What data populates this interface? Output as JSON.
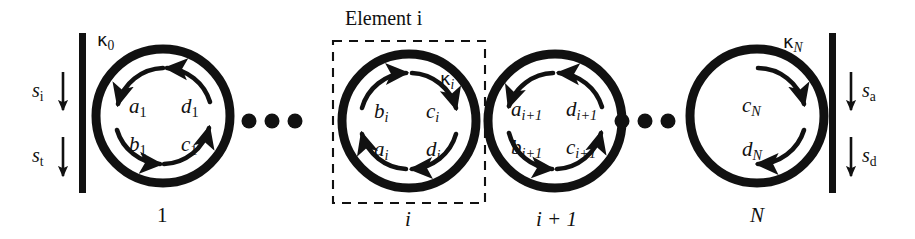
{
  "figure": {
    "type": "schematic-diagram",
    "background_color": "#ffffff",
    "ink_color": "#111111",
    "width": 915,
    "height": 239
  },
  "annotations": {
    "element_box_label": "Element",
    "element_box_index": "i"
  },
  "ports": {
    "left": [
      {
        "name": "s-incident",
        "symbol": "s",
        "subscript": "i",
        "direction": "down"
      },
      {
        "name": "s-transmitted",
        "symbol": "s",
        "subscript": "t",
        "direction": "down"
      }
    ],
    "right": [
      {
        "name": "s-add",
        "symbol": "s",
        "subscript": "a",
        "direction": "down"
      },
      {
        "name": "s-drop",
        "symbol": "s",
        "subscript": "d",
        "direction": "down"
      }
    ]
  },
  "couplings": [
    {
      "name": "kappa-0",
      "glyph": "κ",
      "subscript": "0",
      "italic_subscript": false
    },
    {
      "name": "kappa-i",
      "glyph": "κ",
      "subscript": "i",
      "italic_subscript": true
    },
    {
      "name": "kappa-N",
      "glyph": "κ",
      "subscript": "N",
      "italic_subscript": true
    }
  ],
  "rings": [
    {
      "id": "ring-1",
      "bottom_label": "1",
      "bottom_label_italic": false,
      "flow": "left-down-right-up",
      "amplitudes": [
        {
          "symbol": "a",
          "subscript": "1",
          "italic_subscript": false,
          "position": "upper-left"
        },
        {
          "symbol": "d",
          "subscript": "1",
          "italic_subscript": false,
          "position": "upper-right"
        },
        {
          "symbol": "b",
          "subscript": "1",
          "italic_subscript": false,
          "position": "lower-left"
        },
        {
          "symbol": "c",
          "subscript": "1",
          "italic_subscript": false,
          "position": "lower-right"
        }
      ]
    },
    {
      "id": "ring-i",
      "bottom_label": "i",
      "bottom_label_italic": true,
      "flow": "left-up-right-down",
      "amplitudes": [
        {
          "symbol": "b",
          "subscript": "i",
          "italic_subscript": true,
          "position": "upper-left"
        },
        {
          "symbol": "c",
          "subscript": "i",
          "italic_subscript": true,
          "position": "upper-right"
        },
        {
          "symbol": "a",
          "subscript": "i",
          "italic_subscript": true,
          "position": "lower-left"
        },
        {
          "symbol": "d",
          "subscript": "i",
          "italic_subscript": true,
          "position": "lower-right"
        }
      ]
    },
    {
      "id": "ring-i-plus-1",
      "bottom_label": "i + 1",
      "bottom_label_italic": true,
      "flow": "left-down-right-up",
      "amplitudes": [
        {
          "symbol": "a",
          "subscript": "i+1",
          "italic_subscript": true,
          "position": "upper-left"
        },
        {
          "symbol": "d",
          "subscript": "i+1",
          "italic_subscript": true,
          "position": "upper-right"
        },
        {
          "symbol": "b",
          "subscript": "i+1",
          "italic_subscript": true,
          "position": "lower-left"
        },
        {
          "symbol": "c",
          "subscript": "i+1",
          "italic_subscript": true,
          "position": "lower-right"
        }
      ]
    },
    {
      "id": "ring-N",
      "bottom_label": "N",
      "bottom_label_italic": true,
      "flow": "right-down-only",
      "amplitudes": [
        {
          "symbol": "c",
          "subscript": "N",
          "italic_subscript": true,
          "position": "upper-right"
        },
        {
          "symbol": "d",
          "subscript": "N",
          "italic_subscript": true,
          "position": "lower-right"
        }
      ]
    }
  ],
  "ellipses": [
    {
      "name": "ellipsis-left",
      "dots": 3
    },
    {
      "name": "ellipsis-right",
      "dots": 3
    }
  ],
  "labels": {
    "element_i": "Element i",
    "s_i": "s",
    "s_i_sub": "i",
    "s_t": "s",
    "s_t_sub": "t",
    "s_a": "s",
    "s_a_sub": "a",
    "s_d": "s",
    "s_d_sub": "d",
    "kappa0": "κ",
    "kappa0_sub": "0",
    "kappai": "κ",
    "kappai_sub": "i",
    "kappaN": "κ",
    "kappaN_sub": "N",
    "a1": "a",
    "a1_sub": "1",
    "b1": "b",
    "b1_sub": "1",
    "c1": "c",
    "c1_sub": "1",
    "d1": "d",
    "d1_sub": "1",
    "ai": "a",
    "ai_sub": "i",
    "bi": "b",
    "bi_sub": "i",
    "ci": "c",
    "ci_sub": "i",
    "di": "d",
    "di_sub": "i",
    "ai1": "a",
    "ai1_sub": "i+1",
    "bi1": "b",
    "bi1_sub": "i+1",
    "ci1": "c",
    "ci1_sub": "i+1",
    "di1": "d",
    "di1_sub": "i+1",
    "cN": "c",
    "cN_sub": "N",
    "dN": "d",
    "dN_sub": "N",
    "ring1_bottom": "1",
    "ringi_bottom": "i",
    "ringi1_bottom": "i + 1",
    "ringN_bottom": "N"
  }
}
